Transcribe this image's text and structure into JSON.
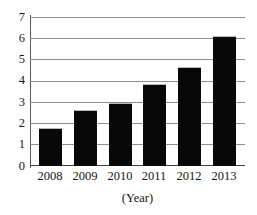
{
  "chart_data": {
    "type": "bar",
    "title": "",
    "subtitle": "",
    "categories": [
      "2008",
      "2009",
      "2010",
      "2011",
      "2012",
      "2013"
    ],
    "values": [
      1.8,
      2.65,
      3.0,
      3.9,
      4.7,
      6.15
    ],
    "series": [
      {
        "name": "",
        "values": [
          1.8,
          2.65,
          3.0,
          3.9,
          4.7,
          6.15
        ]
      }
    ],
    "xlabel": "(Year)",
    "ylabel": "",
    "ylim": [
      0,
      7
    ],
    "xlim_categorical": true,
    "y_ticks": [
      0,
      1,
      2,
      3,
      4,
      5,
      6,
      7
    ],
    "y_tick_labels": [
      "0",
      "1",
      "2",
      "3",
      "4",
      "5",
      "6",
      "7"
    ],
    "grid": true,
    "grid_axis": "y",
    "legend": false,
    "legend_position": "none",
    "bar_color": "#080808",
    "grid_color": "#8c8c8c",
    "axis_color": "#5a5a5a",
    "background_color": "#ffffff",
    "annotations": []
  },
  "axes": {
    "y_labels": [
      "7",
      "6",
      "5",
      "4",
      "3",
      "2",
      "1",
      "0"
    ],
    "x_labels": [
      "2008",
      "2009",
      "2010",
      "2011",
      "2012",
      "2013"
    ],
    "x_title": "(Year)"
  }
}
